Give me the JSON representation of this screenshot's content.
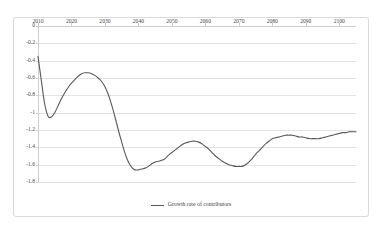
{
  "chart_data": {
    "type": "line",
    "title": "",
    "xlabel": "",
    "ylabel": "",
    "xlim": [
      2010,
      2105
    ],
    "ylim": [
      -1.8,
      0
    ],
    "grid": true,
    "legend_position": "bottom",
    "x_ticks": [
      2010,
      2020,
      2030,
      2040,
      2050,
      2060,
      2070,
      2080,
      2090,
      2100
    ],
    "y_ticks": [
      0,
      -0.2,
      -0.4,
      -0.6,
      -0.8,
      -1,
      -1.2,
      -1.4,
      -1.6,
      -1.8
    ],
    "x_tick_labels": [
      "2010",
      "2020",
      "2030",
      "2040",
      "2050",
      "2060",
      "2070",
      "2080",
      "2090",
      "2100"
    ],
    "y_tick_labels": [
      "0",
      "-0.2",
      "-0.4",
      "-0.6",
      "-0.8",
      "-1",
      "-1.2",
      "-1.4",
      "-1.6",
      "-1.8"
    ],
    "series": [
      {
        "name": "Growth rate of contributors",
        "color": "#595959",
        "x": [
          2010,
          2011,
          2012,
          2013,
          2014,
          2015,
          2016,
          2017,
          2018,
          2019,
          2020,
          2021,
          2022,
          2023,
          2024,
          2025,
          2026,
          2027,
          2028,
          2029,
          2030,
          2031,
          2032,
          2033,
          2034,
          2035,
          2036,
          2037,
          2038,
          2039,
          2040,
          2041,
          2042,
          2043,
          2044,
          2045,
          2046,
          2047,
          2048,
          2049,
          2050,
          2051,
          2052,
          2053,
          2054,
          2055,
          2056,
          2057,
          2058,
          2059,
          2060,
          2061,
          2062,
          2063,
          2064,
          2065,
          2066,
          2067,
          2068,
          2069,
          2070,
          2071,
          2072,
          2073,
          2074,
          2075,
          2076,
          2077,
          2078,
          2079,
          2080,
          2081,
          2082,
          2083,
          2084,
          2085,
          2086,
          2087,
          2088,
          2089,
          2090,
          2091,
          2092,
          2093,
          2094,
          2095,
          2096,
          2097,
          2098,
          2099,
          2100,
          2101,
          2102,
          2103,
          2104,
          2105
        ],
        "values": [
          -0.35,
          -0.63,
          -0.9,
          -1.04,
          -1.05,
          -1.0,
          -0.92,
          -0.84,
          -0.77,
          -0.71,
          -0.66,
          -0.62,
          -0.58,
          -0.55,
          -0.54,
          -0.54,
          -0.55,
          -0.57,
          -0.6,
          -0.64,
          -0.7,
          -0.79,
          -0.91,
          -1.05,
          -1.2,
          -1.34,
          -1.47,
          -1.57,
          -1.63,
          -1.66,
          -1.66,
          -1.65,
          -1.64,
          -1.62,
          -1.59,
          -1.57,
          -1.56,
          -1.55,
          -1.53,
          -1.49,
          -1.46,
          -1.43,
          -1.4,
          -1.37,
          -1.35,
          -1.34,
          -1.33,
          -1.33,
          -1.34,
          -1.36,
          -1.39,
          -1.42,
          -1.46,
          -1.5,
          -1.53,
          -1.56,
          -1.58,
          -1.6,
          -1.61,
          -1.62,
          -1.62,
          -1.62,
          -1.6,
          -1.57,
          -1.53,
          -1.48,
          -1.44,
          -1.4,
          -1.36,
          -1.33,
          -1.3,
          -1.29,
          -1.28,
          -1.27,
          -1.26,
          -1.26,
          -1.26,
          -1.27,
          -1.28,
          -1.28,
          -1.29,
          -1.3,
          -1.3,
          -1.3,
          -1.3,
          -1.29,
          -1.28,
          -1.27,
          -1.26,
          -1.25,
          -1.24,
          -1.23,
          -1.23,
          -1.22,
          -1.22,
          -1.22
        ]
      }
    ]
  },
  "legend": {
    "items": [
      {
        "label": "Growth rate of contributors"
      }
    ]
  }
}
